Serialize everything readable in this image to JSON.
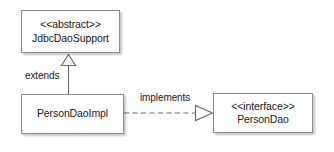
{
  "diagram": {
    "canvas": {
      "width": 334,
      "height": 152,
      "background": "#ffffff"
    },
    "colors": {
      "box_fill": "#ffffff",
      "box_border": "#8d8d8d",
      "connector": "#6e6e6e",
      "text": "#1a1a1a",
      "shadow": "rgba(0,0,0,0.22)"
    },
    "nodes": [
      {
        "id": "jdbcdaosupport",
        "stereotype": "<<abstract>>",
        "name": "JdbcDaoSupport",
        "kind": "abstract-class"
      },
      {
        "id": "persondaoimpl",
        "stereotype": "",
        "name": "PersonDaoImpl",
        "kind": "class"
      },
      {
        "id": "persondao",
        "stereotype": "<<interface>>",
        "name": "PersonDao",
        "kind": "interface"
      }
    ],
    "edges": [
      {
        "id": "extends",
        "label": "extends",
        "from": "persondaoimpl",
        "to": "jdbcdaosupport",
        "type": "generalization",
        "line": "solid",
        "arrowhead": "hollow-triangle"
      },
      {
        "id": "implements",
        "label": "implements",
        "from": "persondaoimpl",
        "to": "persondao",
        "type": "realization",
        "line": "dashed",
        "arrowhead": "hollow-triangle"
      }
    ]
  }
}
